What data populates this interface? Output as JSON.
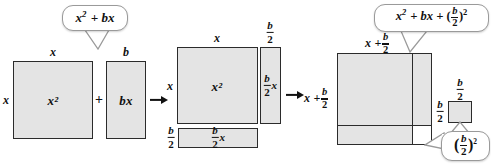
{
  "figure": {
    "fill_color": "#e4e4e4",
    "stroke_color": "#2b2b2b",
    "bubble_border_color": "#9a9a9a",
    "background": "#ffffff"
  },
  "panel1": {
    "name": "x-squared-plus-bx",
    "callout": {
      "text": "x² + bx",
      "base": "x",
      "exp": "2",
      "rest": "+ bx"
    },
    "square": {
      "interior_label": "x²",
      "top_label": "x",
      "left_label": "x"
    },
    "plus_sign": "+",
    "rectangle": {
      "interior_label": "bx",
      "top_label": "b"
    }
  },
  "panel2": {
    "name": "split-bx-into-halves",
    "square": {
      "interior_label": "x²",
      "top_label": "x",
      "left_label": "x"
    },
    "right_strip": {
      "interior_label": "(b/2)x",
      "top_label": "b/2",
      "num": "b",
      "den": "2",
      "suffix": "x"
    },
    "bottom_strip": {
      "interior_label": "(b/2)x",
      "left_label": "b/2",
      "num": "b",
      "den": "2",
      "suffix": "x"
    },
    "result_label": {
      "prefix": "x +",
      "num": "b",
      "den": "2"
    }
  },
  "panel3": {
    "name": "completed-square",
    "callout": {
      "text": "x² + bx + (b/2)²",
      "base": "x",
      "exp": "2",
      "mid": "+ bx +",
      "num": "b",
      "den": "2",
      "outer_exp": "2"
    },
    "top_label": {
      "prefix": "x +",
      "num": "b",
      "den": "2"
    },
    "left_label": {
      "prefix": "x +",
      "num": "b",
      "den": "2"
    },
    "missing_square": {
      "top_label": {
        "num": "b",
        "den": "2"
      },
      "left_label": {
        "num": "b",
        "den": "2"
      }
    },
    "bottom_callout": {
      "num": "b",
      "den": "2",
      "exp": "2"
    }
  },
  "arrows": {
    "arrow1_name": "arrow-to-panel2",
    "arrow2_name": "arrow-to-panel3"
  }
}
